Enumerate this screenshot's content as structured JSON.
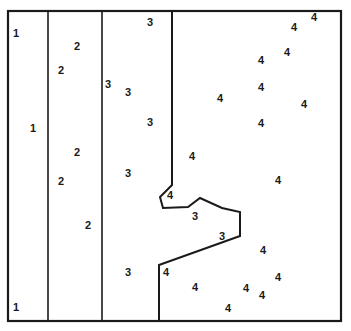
{
  "figure": {
    "background_color": "#ffffff",
    "line_color": "#1a1a1a",
    "label_color": "#1a1a1a",
    "width": 351,
    "height": 331
  },
  "boundaries": {
    "outer_frame": {
      "x": 8,
      "y": 11,
      "width": 333,
      "height": 310,
      "stroke_width": 2.2
    },
    "vertical_lines": [
      {
        "name": "divider-zone1-zone2",
        "x": 48,
        "y1": 11,
        "y2": 321,
        "stroke_width": 1.6
      },
      {
        "name": "divider-zone2-zone3",
        "x": 102,
        "y1": 11,
        "y2": 321,
        "stroke_width": 1.6
      }
    ],
    "jagged_line": {
      "name": "divider-zone3-zone4",
      "stroke_width": 2.0,
      "points": [
        [
          172,
          11
        ],
        [
          172,
          185
        ],
        [
          160,
          197
        ],
        [
          163,
          208
        ],
        [
          188,
          207
        ],
        [
          200,
          198
        ],
        [
          222,
          208
        ],
        [
          240,
          212
        ],
        [
          240,
          236
        ],
        [
          159,
          265
        ],
        [
          159,
          321
        ]
      ]
    }
  },
  "labels": [
    {
      "value": "1",
      "x": 16,
      "y": 33
    },
    {
      "value": "1",
      "x": 33,
      "y": 128
    },
    {
      "value": "1",
      "x": 16,
      "y": 307
    },
    {
      "value": "2",
      "x": 77,
      "y": 46
    },
    {
      "value": "2",
      "x": 61,
      "y": 70
    },
    {
      "value": "2",
      "x": 77,
      "y": 152
    },
    {
      "value": "2",
      "x": 61,
      "y": 181
    },
    {
      "value": "2",
      "x": 88,
      "y": 225
    },
    {
      "value": "3",
      "x": 150,
      "y": 22
    },
    {
      "value": "3",
      "x": 108,
      "y": 84
    },
    {
      "value": "3",
      "x": 128,
      "y": 92
    },
    {
      "value": "3",
      "x": 150,
      "y": 122
    },
    {
      "value": "3",
      "x": 128,
      "y": 173
    },
    {
      "value": "3",
      "x": 195,
      "y": 216
    },
    {
      "value": "3",
      "x": 222,
      "y": 236
    },
    {
      "value": "3",
      "x": 128,
      "y": 272
    },
    {
      "value": "4",
      "x": 314,
      "y": 17
    },
    {
      "value": "4",
      "x": 294,
      "y": 27
    },
    {
      "value": "4",
      "x": 287,
      "y": 52
    },
    {
      "value": "4",
      "x": 261,
      "y": 60
    },
    {
      "value": "4",
      "x": 220,
      "y": 98
    },
    {
      "value": "4",
      "x": 261,
      "y": 87
    },
    {
      "value": "4",
      "x": 304,
      "y": 104
    },
    {
      "value": "4",
      "x": 261,
      "y": 123
    },
    {
      "value": "4",
      "x": 192,
      "y": 156
    },
    {
      "value": "4",
      "x": 278,
      "y": 180
    },
    {
      "value": "4",
      "x": 170,
      "y": 195
    },
    {
      "value": "4",
      "x": 263,
      "y": 250
    },
    {
      "value": "4",
      "x": 166,
      "y": 272
    },
    {
      "value": "4",
      "x": 195,
      "y": 287
    },
    {
      "value": "4",
      "x": 246,
      "y": 288
    },
    {
      "value": "4",
      "x": 278,
      "y": 277
    },
    {
      "value": "4",
      "x": 262,
      "y": 295
    },
    {
      "value": "4",
      "x": 228,
      "y": 308
    }
  ]
}
